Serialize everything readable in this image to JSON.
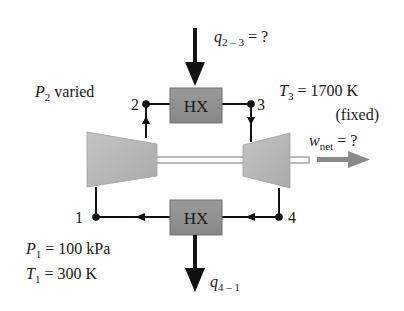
{
  "diagram": {
    "type": "Brayton cycle schematic",
    "colors": {
      "component_fill": "#b3b3b3",
      "hx_fill": "#8f8f8f",
      "line": "#111111",
      "work_arrow": "#8a8a8a"
    },
    "components": {
      "hx_top": {
        "label": "HX"
      },
      "hx_bottom": {
        "label": "HX"
      },
      "compressor": {
        "label": ""
      },
      "turbine": {
        "label": ""
      }
    },
    "states": {
      "s1": "1",
      "s2": "2",
      "s3": "3",
      "s4": "4"
    },
    "annotations": {
      "q23_sym": "q",
      "q23_sub": "2 – 3",
      "q23_rest": " = ?",
      "p2_sym": "P",
      "p2_sub": "2",
      "p2_rest": " varied",
      "t3_sym": "T",
      "t3_sub": "3",
      "t3_rest": " = 1700 K",
      "t3_note": "(fixed)",
      "wnet_sym": "w",
      "wnet_sub": "net",
      "wnet_rest": " = ?",
      "p1_sym": "P",
      "p1_sub": "1",
      "p1_rest": " = 100 kPa",
      "t1_sym": "T",
      "t1_sub": "1",
      "t1_rest": " = 300 K",
      "q41_sym": "q",
      "q41_sub": "4 – 1"
    }
  }
}
